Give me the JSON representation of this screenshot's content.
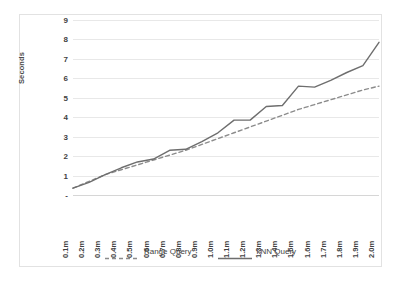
{
  "chart_data": {
    "type": "line",
    "title": "",
    "xlabel": "",
    "ylabel": "Seconds",
    "ylim": [
      0,
      9
    ],
    "ytick_values": [
      0,
      1,
      2,
      3,
      4,
      5,
      6,
      7,
      8,
      9
    ],
    "ytick_labels": [
      "-",
      "1",
      "2",
      "3",
      "4",
      "5",
      "6",
      "7",
      "8",
      "9"
    ],
    "grid": true,
    "legend_position": "bottom",
    "categories": [
      "0.1m",
      "0.2m",
      "0.3m",
      "0.4m",
      "0.5m",
      "0.6m",
      "0.7m",
      "0.8m",
      "0.9m",
      "1.0m",
      "1.1m",
      "1.2m",
      "1.3m",
      "1.4m",
      "1.5m",
      "1.6m",
      "1.7m",
      "1.8m",
      "1.9m",
      "2.0m"
    ],
    "series": [
      {
        "name": "Range Query",
        "style": "dashed",
        "color": "#8c8c8c",
        "values": [
          0.35,
          0.7,
          1.05,
          1.3,
          1.55,
          1.8,
          2.05,
          2.3,
          2.6,
          2.9,
          3.2,
          3.5,
          3.8,
          4.1,
          4.4,
          4.65,
          4.9,
          5.15,
          5.4,
          5.6
        ]
      },
      {
        "name": "kNN Query",
        "style": "solid",
        "color": "#6e6e6e",
        "values": [
          0.35,
          0.65,
          1.05,
          1.4,
          1.7,
          1.85,
          2.3,
          2.35,
          2.75,
          3.2,
          3.85,
          3.85,
          4.55,
          4.6,
          5.6,
          5.55,
          5.9,
          6.3,
          6.65,
          7.85
        ]
      }
    ]
  },
  "legend": {
    "items": [
      {
        "label": "Range Query"
      },
      {
        "label": "kNN Query"
      }
    ]
  }
}
